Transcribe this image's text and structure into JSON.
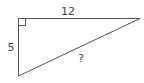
{
  "diagram": {
    "type": "right-triangle",
    "labels": {
      "top_side": "12",
      "left_side": "5",
      "hypotenuse": "?"
    },
    "right_angle_marker": true,
    "stroke_color": "#555555"
  }
}
